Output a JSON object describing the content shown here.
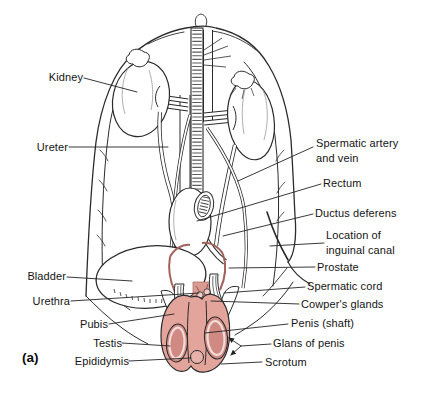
{
  "panel_label": "(a)",
  "labels": {
    "kidney": "Kidney",
    "ureter": "Ureter",
    "spermatic_artery_and_vein": "Spermatic artery\nand vein",
    "rectum": "Rectum",
    "ductus_deferens": "Ductus deferens",
    "inguinal_canal": "Location of\ninguinal canal",
    "prostate": "Prostate",
    "spermatic_cord": "Spermatic cord",
    "cowpers_glands": "Cowper's glands",
    "penis_shaft": "Penis (shaft)",
    "glans_of_penis": "Glans of penis",
    "scrotum": "Scrotum",
    "bladder": "Bladder",
    "urethra": "Urethra",
    "pubis": "Pubis",
    "testis": "Testis",
    "epididymis": "Epididymis"
  },
  "colors": {
    "line": "#2b2b2b",
    "leader_line": "#222222",
    "skin_pink": "#e3a49c",
    "testis_pink": "#d18a83",
    "epididymis_pink": "#e8b2aa",
    "ductus_red": "#a4625b",
    "background": "#ffffff"
  }
}
